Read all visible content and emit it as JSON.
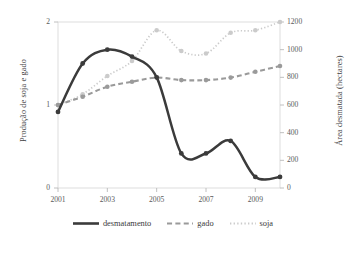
{
  "chart_data": {
    "type": "line",
    "title": "",
    "xlabel": "",
    "ylabel": "Produção de soja e gado",
    "ylabel_secondary": "Área desmatada (hectares)",
    "x": [
      2001,
      2002,
      2003,
      2004,
      2005,
      2006,
      2007,
      2008,
      2009,
      2010
    ],
    "xtick_labels": [
      "2001",
      "2003",
      "2005",
      "2007",
      "2009"
    ],
    "xtick_values": [
      2001,
      2003,
      2005,
      2007,
      2009
    ],
    "xlim": [
      2001,
      2010
    ],
    "ylim": [
      0,
      2
    ],
    "ytick_labels": [
      "0",
      "1",
      "2"
    ],
    "ytick_values": [
      0,
      1,
      2
    ],
    "ylim_secondary": [
      0,
      1200
    ],
    "ytick_labels_secondary": [
      "0",
      "200",
      "400",
      "600",
      "800",
      "1000",
      "1200"
    ],
    "ytick_values_secondary": [
      0,
      200,
      400,
      600,
      800,
      1000,
      1200
    ],
    "grid": false,
    "legend_position": "bottom",
    "series": [
      {
        "name": "desmatamento",
        "axis": "right",
        "unit": "hectares",
        "style": "solid",
        "color": "#3b3b3b",
        "values": [
          550,
          900,
          1000,
          950,
          800,
          250,
          250,
          340,
          80,
          80
        ]
      },
      {
        "name": "gado",
        "axis": "left",
        "unit": "",
        "style": "dashed",
        "color": "#9a9a9a",
        "values": [
          1.0,
          1.1,
          1.22,
          1.28,
          1.33,
          1.3,
          1.3,
          1.33,
          1.4,
          1.47
        ]
      },
      {
        "name": "soja",
        "axis": "left",
        "unit": "",
        "style": "dotted",
        "color": "#cbcbcb",
        "values": [
          1.0,
          1.13,
          1.35,
          1.53,
          1.9,
          1.65,
          1.62,
          1.87,
          1.9,
          2.0
        ]
      }
    ]
  },
  "axes": {
    "left_title": "Produção de soja e gado",
    "right_title": "Área desmatada (hectares)"
  },
  "legend": {
    "items": [
      {
        "label": "desmatamento",
        "color": "#3b3b3b",
        "style": "solid"
      },
      {
        "label": "gado",
        "color": "#9a9a9a",
        "style": "dashed"
      },
      {
        "label": "soja",
        "color": "#cbcbcb",
        "style": "dotted"
      }
    ]
  },
  "colors": {
    "desmatamento": "#3b3b3b",
    "gado": "#9a9a9a",
    "soja": "#cbcbcb",
    "plot_border": "#d9d9d9",
    "text": "#3a3a3a"
  }
}
